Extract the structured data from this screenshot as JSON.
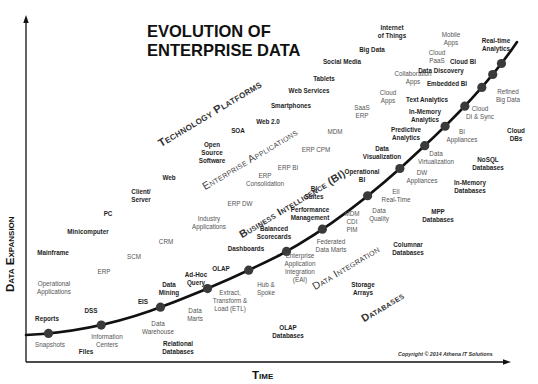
{
  "title": "EVOLUTION OF\nENTERPRISE DATA",
  "axes": {
    "y_label": "Data Expansion",
    "x_label": "Time"
  },
  "copyright": "Copyright © 2014 Athena IT Solutions",
  "categories": [
    {
      "id": "technology-platforms",
      "label": "Technology Platforms"
    },
    {
      "id": "enterprise-applications",
      "label": "Enterprise Applications"
    },
    {
      "id": "business-intelligence",
      "label": "Business Intelligence (BI)"
    },
    {
      "id": "data-integration",
      "label": "Data Integration"
    },
    {
      "id": "databases",
      "label": "Databases"
    }
  ],
  "labels": {
    "technology_platforms": [
      "Mainframe",
      "Minicomputer",
      "PC",
      "Client/\nServer",
      "Web",
      "Open\nSource\nSoftware",
      "SOA",
      "Web 2.0",
      "Smartphones",
      "Web Services",
      "Tablets",
      "Social Media",
      "Big Data",
      "Internet\nof Things"
    ],
    "enterprise_applications": [
      "Operational\nApplications",
      "ERP",
      "SCM",
      "CRM",
      "Industry\nApplications",
      "ERP DW",
      "ERP\nConsolidation",
      "ERP BI",
      "ERP CPM",
      "MDM",
      "SaaS\nERP",
      "Cloud\nApps",
      "Collaboration\nApps",
      "Cloud\nPaaS",
      "Mobile\nApps"
    ],
    "business_intelligence": [
      "Reports",
      "DSS",
      "EIS",
      "Data\nMining",
      "Ad-Hoc\nQuery",
      "OLAP",
      "Dashboards",
      "Balanced\nScorecards",
      "Performance\nManagement",
      "BI\nSuites",
      "Operational\nBI",
      "Data\nVisualization",
      "Predictive\nAnalytics",
      "In-Memory\nAnalytics",
      "Text Analytics",
      "Embedded BI",
      "Data Discovery",
      "Cloud BI",
      "Real-time\nAnalytics"
    ],
    "data_integration": [
      "Snapshots",
      "Information\nCenters",
      "Data\nWarehouse",
      "Data\nMarts",
      "Extract,\nTransform &\nLoad (ETL)",
      "Hub &\nSpoke",
      "Enterprise\nApplication\nIntegration\n(EAI)",
      "Federated\nData Marts",
      "MDM\nCDI\nPIM",
      "Data\nQuality",
      "EII\nReal-Time",
      "DW\nAppliances",
      "Data\nVirtualization",
      "BI\nAppliances",
      "Cloud\nDI & Sync",
      "Refined\nBig Data"
    ],
    "databases": [
      "Files",
      "Relational\nDatabases",
      "OLAP\nDatabases",
      "Storage\nArrays",
      "Columnar\nDatabases",
      "MPP\nDatabases",
      "In-Memory\nDatabases",
      "NoSQL\nDatabases",
      "Cloud\nDBs"
    ]
  },
  "curve_milestones": 15,
  "colors": {
    "curve": "#111111",
    "milestone_dot": "#3a3a3a",
    "axis": "#111111"
  }
}
